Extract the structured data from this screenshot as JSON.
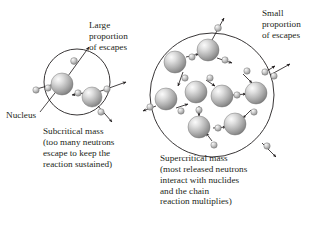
{
  "figure": {
    "type": "diagram",
    "background_color": "#ffffff",
    "line_color": "#231f20",
    "nucleus_fill_light": "#f2f2f2",
    "nucleus_fill_mid": "#b8b8b8",
    "nucleus_fill_dark": "#6e6e6e",
    "neutron_fill_light": "#ededed",
    "neutron_fill_dark": "#8a8a8a"
  },
  "labels": {
    "large_escapes": "Large\nproportion\nof escapes",
    "small_escapes": "Small\nproportion\nof escapes",
    "nucleus": "Nucleus"
  },
  "captions": {
    "subcritical": "Subcritical mass\n(too many neutrons\nescape to keep the\nreaction sustained)",
    "supercritical": "Supercritical mass\n(most released neutrons\ninteract with nuclides\nand the chain\nreaction multiplies)"
  },
  "diagrams": [
    {
      "id": "subcritical",
      "name": "subcritical-mass-diagram",
      "boundary": {
        "cx": 77,
        "cy": 82,
        "r": 33
      },
      "nuclei": [
        {
          "cx": 62,
          "cy": 84,
          "r": 11
        },
        {
          "cx": 92,
          "cy": 97,
          "r": 10
        }
      ],
      "neutrons": [
        {
          "cx": 74,
          "cy": 61,
          "r": 3.4
        },
        {
          "cx": 48,
          "cy": 88,
          "r": 3.2
        },
        {
          "cx": 78,
          "cy": 93,
          "r": 3.2
        },
        {
          "cx": 107,
          "cy": 89,
          "r": 3.2
        },
        {
          "cx": 101,
          "cy": 112,
          "r": 3.2
        },
        {
          "cx": 36,
          "cy": 90,
          "r": 3.2
        }
      ],
      "arrows": [
        {
          "x1": 68,
          "y1": 76,
          "x2": 89,
          "y2": 47
        },
        {
          "x1": 33,
          "y1": 90,
          "x2": 58,
          "y2": 83
        },
        {
          "x1": 84,
          "y1": 93,
          "x2": 72,
          "y2": 95
        },
        {
          "x1": 98,
          "y1": 92,
          "x2": 126,
          "y2": 82
        },
        {
          "x1": 98,
          "y1": 106,
          "x2": 112,
          "y2": 122
        }
      ],
      "leader_line": {
        "x1": 40,
        "y1": 112,
        "x2": 62,
        "y2": 84
      }
    },
    {
      "id": "supercritical",
      "name": "supercritical-mass-diagram",
      "boundary": {
        "cx": 212,
        "cy": 95,
        "r": 62
      },
      "nuclei": [
        {
          "cx": 208,
          "cy": 50,
          "r": 11
        },
        {
          "cx": 175,
          "cy": 62,
          "r": 11
        },
        {
          "cx": 166,
          "cy": 99,
          "r": 11
        },
        {
          "cx": 196,
          "cy": 92,
          "r": 11
        },
        {
          "cx": 222,
          "cy": 96,
          "r": 11
        },
        {
          "cx": 256,
          "cy": 93,
          "r": 11
        },
        {
          "cx": 199,
          "cy": 127,
          "r": 11
        },
        {
          "cx": 235,
          "cy": 124,
          "r": 11
        }
      ],
      "neutrons": [
        {
          "cx": 218,
          "cy": 28,
          "r": 3.4
        },
        {
          "cx": 192,
          "cy": 57,
          "r": 3.2
        },
        {
          "cx": 185,
          "cy": 78,
          "r": 3.2
        },
        {
          "cx": 225,
          "cy": 60,
          "r": 3.2
        },
        {
          "cx": 247,
          "cy": 71,
          "r": 3.2
        },
        {
          "cx": 265,
          "cy": 72,
          "r": 3.2
        },
        {
          "cx": 210,
          "cy": 78,
          "r": 3.2
        },
        {
          "cx": 181,
          "cy": 111,
          "r": 3.2
        },
        {
          "cx": 150,
          "cy": 107,
          "r": 3.2
        },
        {
          "cx": 237,
          "cy": 95,
          "r": 3.2
        },
        {
          "cx": 274,
          "cy": 76,
          "r": 3.2
        },
        {
          "cx": 199,
          "cy": 110,
          "r": 3.2
        },
        {
          "cx": 218,
          "cy": 128,
          "r": 3.2
        },
        {
          "cx": 254,
          "cy": 112,
          "r": 3.2
        },
        {
          "cx": 267,
          "cy": 146,
          "r": 3.2
        },
        {
          "cx": 214,
          "cy": 145,
          "r": 3.2
        }
      ],
      "arrows": [
        {
          "x1": 212,
          "y1": 40,
          "x2": 224,
          "y2": 18
        },
        {
          "x1": 186,
          "y1": 57,
          "x2": 199,
          "y2": 54
        },
        {
          "x1": 183,
          "y1": 72,
          "x2": 178,
          "y2": 86
        },
        {
          "x1": 217,
          "y1": 58,
          "x2": 232,
          "y2": 63
        },
        {
          "x1": 243,
          "y1": 74,
          "x2": 252,
          "y2": 83
        },
        {
          "x1": 262,
          "y1": 74,
          "x2": 275,
          "y2": 66
        },
        {
          "x1": 206,
          "y1": 80,
          "x2": 215,
          "y2": 86
        },
        {
          "x1": 176,
          "y1": 108,
          "x2": 188,
          "y2": 104
        },
        {
          "x1": 156,
          "y1": 106,
          "x2": 143,
          "y2": 111
        },
        {
          "x1": 233,
          "y1": 95,
          "x2": 246,
          "y2": 94
        },
        {
          "x1": 270,
          "y1": 75,
          "x2": 290,
          "y2": 64
        },
        {
          "x1": 199,
          "y1": 106,
          "x2": 199,
          "y2": 116
        },
        {
          "x1": 213,
          "y1": 128,
          "x2": 226,
          "y2": 127
        },
        {
          "x1": 251,
          "y1": 110,
          "x2": 243,
          "y2": 118
        },
        {
          "x1": 262,
          "y1": 143,
          "x2": 276,
          "y2": 157
        },
        {
          "x1": 212,
          "y1": 141,
          "x2": 206,
          "y2": 133
        }
      ]
    }
  ]
}
